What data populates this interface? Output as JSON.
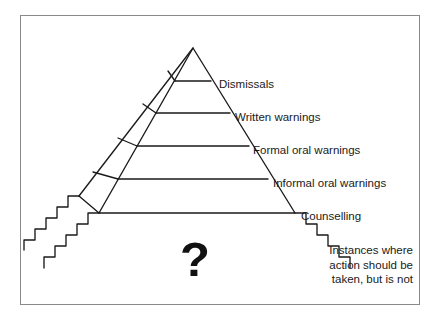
{
  "diagram": {
    "type": "pyramid",
    "stroke_color": "#1a1a1a",
    "frame_color": "#8a8a8a",
    "background": "#ffffff",
    "question_mark": "?",
    "tiers": [
      {
        "id": "tier-1",
        "label": "Dismissals"
      },
      {
        "id": "tier-2",
        "label": "Written warnings"
      },
      {
        "id": "tier-3",
        "label": "Formal oral warnings"
      },
      {
        "id": "tier-4",
        "label": "Informal oral warnings"
      },
      {
        "id": "tier-5",
        "label": "Counselling"
      }
    ],
    "footnote": {
      "line1": "Instances where",
      "line2": "action should be",
      "line3": "taken, but is not"
    }
  }
}
